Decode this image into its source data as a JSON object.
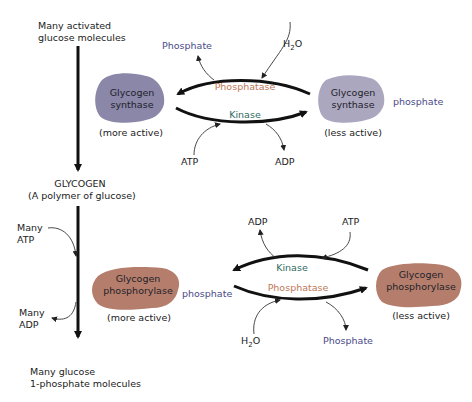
{
  "left_pathway": {
    "start_label_line1": "Many activated",
    "start_label_line2": "glucose molecules",
    "glycogen_label": "GLYCOGEN",
    "glycogen_sub": "(A polymer of glucose)",
    "many_atp_line1": "Many",
    "many_atp_line2": "ATP",
    "many_adp_line1": "Many",
    "many_adp_line2": "ADP",
    "end_label_line1": "Many glucose",
    "end_label_line2": "1-phosphate molecules"
  },
  "synthase_cycle": {
    "left_enzyme_line1": "Glycogen",
    "left_enzyme_line2": "synthase",
    "left_state": "(more active)",
    "right_enzyme_line1": "Glycogen",
    "right_enzyme_line2": "synthase",
    "right_state": "(less active)",
    "right_tag": "phosphate",
    "top_enzyme": "Phosphatase",
    "bottom_enzyme": "Kinase",
    "top_input": "H2O",
    "top_output": "Phosphate",
    "bottom_input": "ATP",
    "bottom_output": "ADP",
    "enzyme_color": "#8a87a8"
  },
  "phosphorylase_cycle": {
    "left_enzyme_line1": "Glycogen",
    "left_enzyme_line2": "phosphorylase",
    "left_state": "(more active)",
    "left_tag": "phosphate",
    "right_enzyme_line1": "Glycogen",
    "right_enzyme_line2": "phosphorylase",
    "right_state": "(less active)",
    "top_enzyme": "Kinase",
    "bottom_enzyme": "Phosphatase",
    "top_input": "ATP",
    "top_output": "ADP",
    "bottom_input": "H2O",
    "bottom_output": "Phosphate",
    "enzyme_color": "#b57e6c"
  }
}
